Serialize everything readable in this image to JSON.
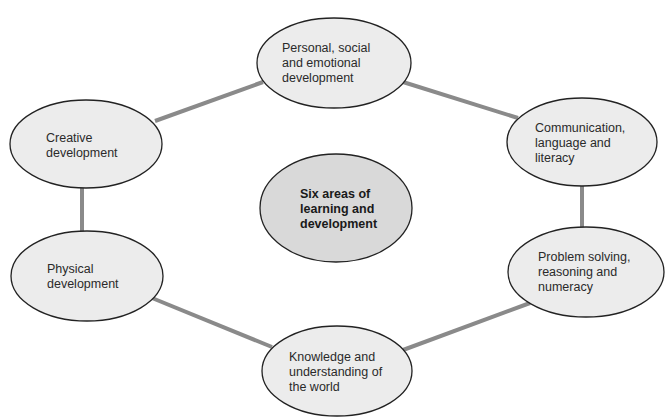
{
  "diagram": {
    "caption_partial": "",
    "center": {
      "label": "Six areas of\nlearning and\ndevelopment",
      "fill": "#d9d9d9"
    },
    "nodes": [
      {
        "id": "personal",
        "label": "Personal, social\nand emotional\ndevelopment"
      },
      {
        "id": "communication",
        "label": "Communication,\nlanguage and\nliteracy"
      },
      {
        "id": "problem",
        "label": "Problem solving,\nreasoning and\nnumeracy"
      },
      {
        "id": "knowledge",
        "label": "Knowledge and\nunderstanding of\nthe world"
      },
      {
        "id": "physical",
        "label": "Physical\ndevelopment"
      },
      {
        "id": "creative",
        "label": "Creative\ndevelopment"
      }
    ],
    "edges": [
      [
        "personal",
        "communication"
      ],
      [
        "communication",
        "problem"
      ],
      [
        "problem",
        "knowledge"
      ],
      [
        "knowledge",
        "physical"
      ],
      [
        "physical",
        "creative"
      ],
      [
        "creative",
        "personal"
      ]
    ],
    "colors": {
      "node_fill": "#ececec",
      "center_fill": "#d9d9d9",
      "outline": "#222222",
      "connector": "#8a8a8a"
    }
  }
}
